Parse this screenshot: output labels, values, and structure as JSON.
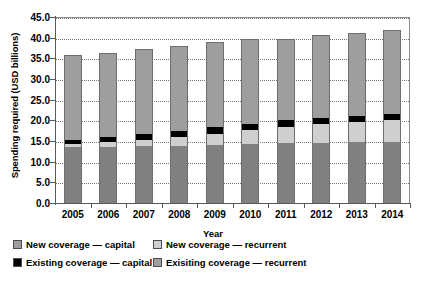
{
  "chart_data": {
    "type": "bar",
    "subtype": "stacked-bar",
    "title": "",
    "xlabel": "Year",
    "ylabel": "Spending required (USD billions)",
    "categories": [
      "2005",
      "2006",
      "2007",
      "2008",
      "2009",
      "2010",
      "2011",
      "2012",
      "2013",
      "2014"
    ],
    "ylim": [
      0.0,
      45.0
    ],
    "yticks": [
      "0.0",
      "5.0",
      "10.0",
      "15.0",
      "20.0",
      "25.0",
      "30.0",
      "35.0",
      "40.0",
      "45.0"
    ],
    "ytick_values": [
      0.0,
      5.0,
      10.0,
      15.0,
      20.0,
      25.0,
      30.0,
      35.0,
      40.0,
      45.0
    ],
    "grid": true,
    "grid_axis": "y",
    "legend_position": "below-axes",
    "stack_order_bottom_to_top": [
      "Exisiting coverage — recurrent",
      "New coverage — recurrent",
      "Existing coverage — capital",
      "New coverage — capital"
    ],
    "series": [
      {
        "name": "Exisiting coverage — recurrent",
        "color": "#808080",
        "values": [
          13.6,
          13.6,
          13.8,
          13.8,
          14.1,
          14.3,
          14.5,
          14.6,
          14.7,
          14.8
        ]
      },
      {
        "name": "New coverage — recurrent",
        "color": "#cfcfcf",
        "values": [
          0.6,
          1.1,
          1.5,
          2.2,
          2.7,
          3.3,
          4.0,
          4.4,
          4.8,
          5.3
        ]
      },
      {
        "name": "Existing coverage — capital",
        "color": "#000000",
        "values": [
          1.1,
          1.2,
          1.4,
          1.5,
          1.5,
          1.5,
          1.5,
          1.5,
          1.5,
          1.5
        ]
      },
      {
        "name": "New coverage — capital",
        "color": "#9e9e9e",
        "values": [
          20.4,
          20.5,
          20.5,
          20.4,
          20.6,
          20.5,
          19.7,
          20.1,
          20.2,
          20.3
        ]
      }
    ],
    "totals": [
      35.7,
      36.4,
      37.2,
      37.9,
      38.9,
      39.6,
      39.7,
      40.6,
      41.2,
      41.9
    ]
  },
  "legend": {
    "items": [
      {
        "label": "New coverage — capital",
        "color": "#9e9e9e"
      },
      {
        "label": "New coverage — recurrent",
        "color": "#cfcfcf"
      },
      {
        "label": "Existing coverage — capital",
        "color": "#000000"
      },
      {
        "label": "Exisiting coverage — recurrent",
        "color": "#9e9e9e"
      }
    ]
  }
}
